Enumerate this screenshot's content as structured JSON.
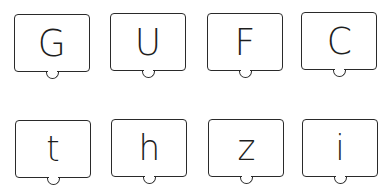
{
  "cards": [
    {
      "letter": "G",
      "case": "upper",
      "left": 14,
      "top": 14
    },
    {
      "letter": "U",
      "case": "upper",
      "left": 110,
      "top": 13
    },
    {
      "letter": "F",
      "case": "upper",
      "left": 207,
      "top": 13
    },
    {
      "letter": "C",
      "case": "upper",
      "left": 301,
      "top": 12
    },
    {
      "letter": "t",
      "case": "lower",
      "left": 15,
      "top": 120
    },
    {
      "letter": "h",
      "case": "lower",
      "left": 111,
      "top": 119
    },
    {
      "letter": "z",
      "case": "lower",
      "left": 208,
      "top": 119
    },
    {
      "letter": "i",
      "case": "lower",
      "left": 302,
      "top": 119
    }
  ],
  "colors": {
    "stroke": "#2a2a2a",
    "letter": "#1e1e1e",
    "background": "#ffffff"
  }
}
